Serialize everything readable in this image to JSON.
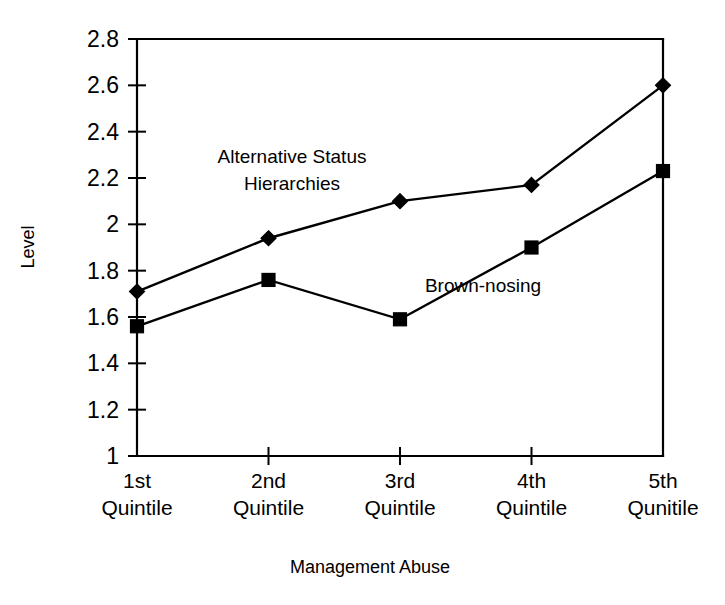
{
  "chart_data": {
    "type": "line",
    "title": "",
    "xlabel": "Management Abuse",
    "ylabel": "Level",
    "categories": [
      "1st Quintile",
      "2nd Quintile",
      "3rd Quintile",
      "4th Quintile",
      "5th Qunitile"
    ],
    "category_lines": [
      [
        "1st",
        "Quintile"
      ],
      [
        "2nd",
        "Quintile"
      ],
      [
        "3rd",
        "Quintile"
      ],
      [
        "4th",
        "Quintile"
      ],
      [
        "5th",
        "Qunitile"
      ]
    ],
    "ylim": [
      1,
      2.8
    ],
    "ytick_labels": [
      "1",
      "1.2",
      "1.4",
      "1.6",
      "1.8",
      "2",
      "2.2",
      "2.4",
      "2.6",
      "2.8"
    ],
    "ytick_values": [
      1,
      1.2,
      1.4,
      1.6,
      1.8,
      2,
      2.2,
      2.4,
      2.6,
      2.8
    ],
    "grid": false,
    "legend": "none",
    "series": [
      {
        "name": "Alternative Status Hierarchies",
        "marker": "diamond",
        "color": "#000000",
        "values": [
          1.71,
          1.94,
          2.1,
          2.17,
          2.6
        ]
      },
      {
        "name": "Brown-nosing",
        "marker": "square",
        "color": "#000000",
        "values": [
          1.56,
          1.76,
          1.59,
          1.9,
          2.23
        ]
      }
    ],
    "annotations": [
      {
        "text_lines": [
          "Alternative Status",
          "Hierarchies"
        ],
        "x": 292,
        "y": 163
      },
      {
        "text_lines": [
          "Brown-nosing"
        ],
        "x": 483,
        "y": 292
      }
    ]
  },
  "axis_titles": {
    "x": "Management Abuse",
    "y": "Level"
  }
}
